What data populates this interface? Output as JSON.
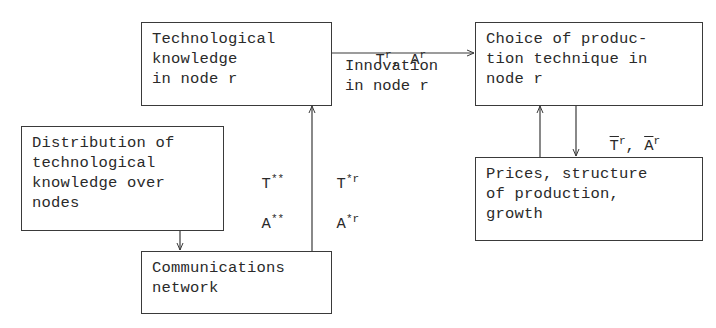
{
  "diagram": {
    "nodes": {
      "tech_knowledge": {
        "label": "Technological\nknowledge\nin node r"
      },
      "choice_technique": {
        "label": "Choice of produc-\ntion technique in\nnode r"
      },
      "distribution": {
        "label": "Distribution of\ntechnological\nknowledge over\nnodes"
      },
      "prices": {
        "label": "Prices, structure\nof production,\ngrowth"
      },
      "comm_network": {
        "label": "Communications\nnetwork"
      }
    },
    "edges": {
      "tech_to_choice": {
        "symbol_T": "T",
        "symbol_T_sup": "r",
        "sep": ", ",
        "symbol_A": "A",
        "symbol_A_sup": "r",
        "caption": "Innovation\nin node r"
      },
      "choice_to_prices": {
        "symbol_T": "T",
        "symbol_T_sup": "r",
        "sep": ", ",
        "symbol_A": "A",
        "symbol_A_sup": "r"
      },
      "distribution_labels": {
        "T": "T",
        "T_sup": "**",
        "A": "A",
        "A_sup": "**"
      },
      "network_to_tech": {
        "T": "T",
        "T_sup": "*r",
        "A": "A",
        "A_sup": "*r"
      }
    },
    "colors": {
      "line": "#3a3a3a",
      "text": "#2a2a2a",
      "background": "#ffffff"
    }
  }
}
